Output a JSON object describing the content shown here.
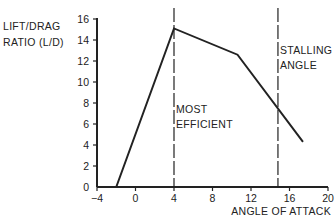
{
  "chart_data": {
    "type": "line",
    "title": "",
    "xlabel": "ANGLE OF ATTACK",
    "ylabel": "LIFT/DRAG RATIO (L/D)",
    "ylabel_lines": [
      "LIFT/DRAG",
      "RATIO (L/D)"
    ],
    "xlim": [
      -4,
      20
    ],
    "ylim": [
      0,
      16
    ],
    "x_ticks": [
      -4,
      0,
      4,
      8,
      12,
      16,
      20
    ],
    "x_tick_labels": [
      "−4",
      "0",
      "4",
      "8",
      "12",
      "16",
      "20"
    ],
    "y_ticks": [
      0,
      2,
      4,
      6,
      8,
      10,
      12,
      14,
      16
    ],
    "y_tick_labels": [
      "0",
      "2",
      "4",
      "6",
      "8",
      "10",
      "12",
      "14",
      "16"
    ],
    "grid": false,
    "series": [
      {
        "name": "L/D ratio",
        "x": [
          -2,
          4,
          10.6,
          17.4
        ],
        "y": [
          0,
          15.1,
          12.6,
          4.3
        ]
      }
    ],
    "annotations": [
      {
        "type": "vline",
        "x": 4,
        "style": "dashed",
        "label_lines": [
          "MOST",
          "EFFICIENT"
        ]
      },
      {
        "type": "vline",
        "x": 14.8,
        "style": "dashed",
        "label_lines": [
          "STALLING",
          "ANGLE"
        ]
      }
    ]
  }
}
